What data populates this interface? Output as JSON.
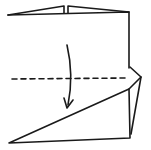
{
  "diagram": {
    "type": "origami-fold-step",
    "stroke_color": "#1a1a1a",
    "background": "#ffffff",
    "fold_line": "valley-fold (dashed)",
    "arrow": "fold top edge down toward bottom",
    "elements": [
      "paper-square",
      "top-flaps",
      "right-side-flap",
      "valley-fold-line",
      "fold-arrow"
    ]
  }
}
